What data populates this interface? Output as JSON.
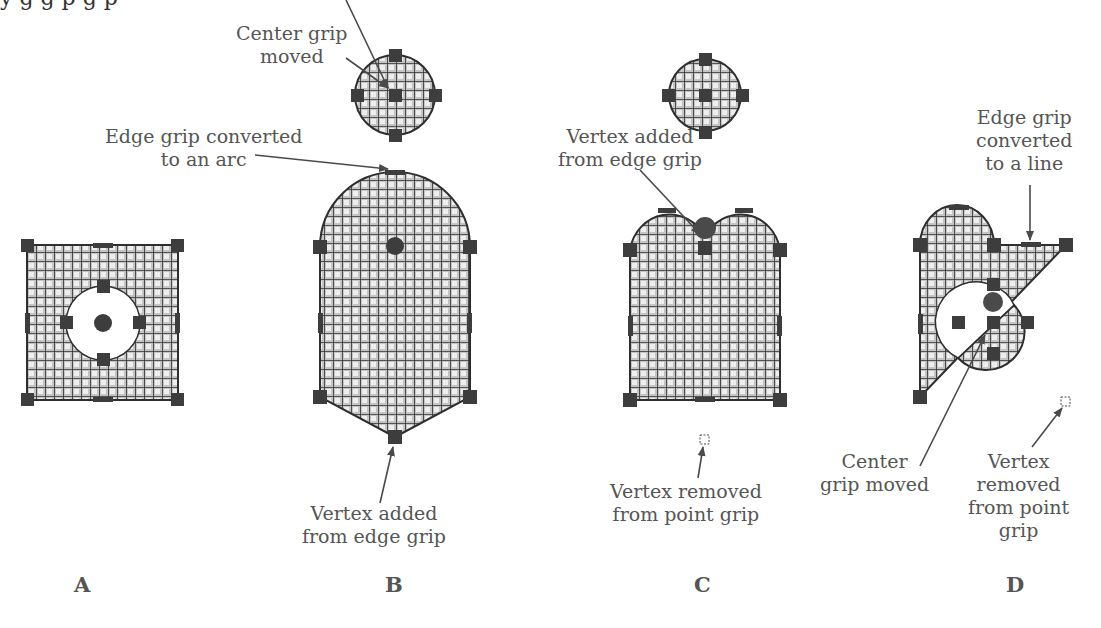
{
  "top_partial_text": "y  g  g  p  g  p",
  "colors": {
    "fill": "#b9b9b9",
    "grid": "#2e2e2e",
    "grip": "#3d3d3d",
    "text": "#555555",
    "arrow": "#4a4a4a",
    "background": "#ffffff"
  },
  "panels": [
    {
      "id": "A",
      "letter": "A",
      "labels": []
    },
    {
      "id": "B",
      "letter": "B",
      "labels": [
        {
          "text_lines": [
            "Center grip",
            "moved"
          ]
        },
        {
          "text_lines": [
            "Edge grip converted",
            "to an arc"
          ]
        },
        {
          "text_lines": [
            "Vertex added",
            "from edge grip"
          ]
        }
      ]
    },
    {
      "id": "C",
      "letter": "C",
      "labels": [
        {
          "text_lines": [
            "Vertex added",
            "from edge grip"
          ]
        },
        {
          "text_lines": [
            "Vertex removed",
            "from point grip"
          ]
        }
      ]
    },
    {
      "id": "D",
      "letter": "D",
      "labels": [
        {
          "text_lines": [
            "Edge grip",
            "converted",
            "to a line"
          ]
        },
        {
          "text_lines": [
            "Center",
            "grip moved"
          ]
        },
        {
          "text_lines": [
            "Vertex",
            "removed",
            "from point",
            "grip"
          ]
        }
      ]
    }
  ],
  "labels": {
    "b_center_l1": "Center grip",
    "b_center_l2": "moved",
    "b_arc_l1": "Edge grip converted",
    "b_arc_l2": "to an arc",
    "b_vertex_l1": "Vertex added",
    "b_vertex_l2": "from edge grip",
    "c_vertex_l1": "Vertex added",
    "c_vertex_l2": "from edge grip",
    "c_removed_l1": "Vertex removed",
    "c_removed_l2": "from point grip",
    "d_line_l1": "Edge grip",
    "d_line_l2": "converted",
    "d_line_l3": "to a line",
    "d_center_l1": "Center",
    "d_center_l2": "grip moved",
    "d_removed_l1": "Vertex",
    "d_removed_l2": "removed",
    "d_removed_l3": "from point",
    "d_removed_l4": "grip"
  },
  "letters": {
    "a": "A",
    "b": "B",
    "c": "C",
    "d": "D"
  }
}
